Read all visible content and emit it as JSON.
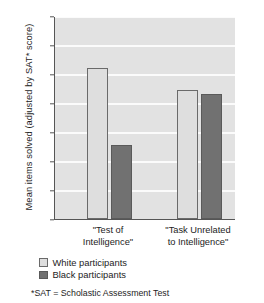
{
  "chart_data": {
    "type": "bar",
    "title": "",
    "subtitle": "",
    "xlabel": "",
    "ylabel": "Mean items solved (adjusted by SAT* score)",
    "ylim": [
      0,
      14
    ],
    "yticks": [
      0,
      2,
      4,
      6,
      8,
      10,
      12,
      14
    ],
    "ytick_labels": [
      "0",
      "2",
      "4",
      "6",
      "8",
      "10",
      "12",
      "14"
    ],
    "grid": "horizontal",
    "legend_position": "below-axis-left",
    "categories": [
      "\"Test of Intelligence\"",
      "\"Task Unrelated to Intelligence\""
    ],
    "category_lines": [
      [
        "\"Test of",
        "Intelligence\""
      ],
      [
        "\"Task Unrelated",
        "to Intelligence\""
      ]
    ],
    "series": [
      {
        "name": "White participants",
        "values": [
          10.4,
          8.9
        ],
        "color": "#dedede"
      },
      {
        "name": "Black participants",
        "values": [
          5.1,
          8.6
        ],
        "color": "#717171"
      }
    ],
    "annotations": [
      "*SAT = Scholastic Assessment Test"
    ]
  },
  "legend": {
    "items": [
      {
        "label": "White participants",
        "swatch": "light"
      },
      {
        "label": "Black participants",
        "swatch": "dark"
      }
    ]
  },
  "footnote": "*SAT = Scholastic Assessment Test",
  "colors": {
    "plot_background": "#e2e2e2",
    "gridline": "#fbfbfb",
    "axis": "#555555",
    "white_participants": "#dedede",
    "black_participants": "#717171",
    "text": "#1d1d1d"
  }
}
